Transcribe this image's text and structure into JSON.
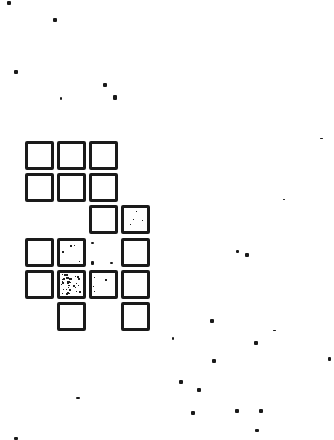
{
  "game": {
    "grid": {
      "origin_x": 25,
      "origin_y": 141,
      "pitch_x": 32,
      "pitch_y": 32.2,
      "cells": [
        {
          "row": 0,
          "col": 0,
          "fill": "empty"
        },
        {
          "row": 0,
          "col": 1,
          "fill": "empty"
        },
        {
          "row": 0,
          "col": 2,
          "fill": "empty"
        },
        {
          "row": 1,
          "col": 0,
          "fill": "empty"
        },
        {
          "row": 1,
          "col": 1,
          "fill": "empty"
        },
        {
          "row": 1,
          "col": 2,
          "fill": "empty"
        },
        {
          "row": 2,
          "col": 2,
          "fill": "empty"
        },
        {
          "row": 2,
          "col": 3,
          "fill": "light"
        },
        {
          "row": 3,
          "col": 0,
          "fill": "empty"
        },
        {
          "row": 3,
          "col": 1,
          "fill": "light"
        },
        {
          "row": 3,
          "col": 3,
          "fill": "empty"
        },
        {
          "row": 4,
          "col": 0,
          "fill": "empty"
        },
        {
          "row": 4,
          "col": 1,
          "fill": "heavy"
        },
        {
          "row": 4,
          "col": 2,
          "fill": "light"
        },
        {
          "row": 4,
          "col": 3,
          "fill": "empty"
        },
        {
          "row": 5,
          "col": 1,
          "fill": "empty"
        },
        {
          "row": 5,
          "col": 3,
          "fill": "empty"
        }
      ]
    },
    "specks": [
      [
        7,
        1,
        4,
        4
      ],
      [
        53,
        18,
        4,
        4
      ],
      [
        14,
        70,
        4,
        4
      ],
      [
        103,
        83,
        4,
        4
      ],
      [
        60,
        97,
        2,
        3
      ],
      [
        113,
        95,
        4,
        5
      ],
      [
        320,
        138,
        3,
        1
      ],
      [
        283,
        199,
        2,
        1
      ],
      [
        236,
        250,
        3,
        3
      ],
      [
        245,
        253,
        4,
        4
      ],
      [
        91,
        242,
        3,
        2
      ],
      [
        91,
        261,
        3,
        4
      ],
      [
        110,
        262,
        3,
        2
      ],
      [
        210,
        319,
        4,
        4
      ],
      [
        172,
        337,
        2,
        3
      ],
      [
        254,
        341,
        4,
        4
      ],
      [
        273,
        330,
        3,
        1
      ],
      [
        212,
        359,
        4,
        4
      ],
      [
        328,
        357,
        3,
        4
      ],
      [
        179,
        380,
        4,
        4
      ],
      [
        197,
        388,
        4,
        4
      ],
      [
        191,
        411,
        4,
        4
      ],
      [
        235,
        409,
        4,
        4
      ],
      [
        259,
        409,
        4,
        4
      ],
      [
        255,
        429,
        4,
        3
      ],
      [
        76,
        397,
        4,
        2
      ],
      [
        14,
        437,
        4,
        3
      ]
    ],
    "colors": {
      "ink": "#1a1a1a",
      "background": "#ffffff"
    }
  }
}
